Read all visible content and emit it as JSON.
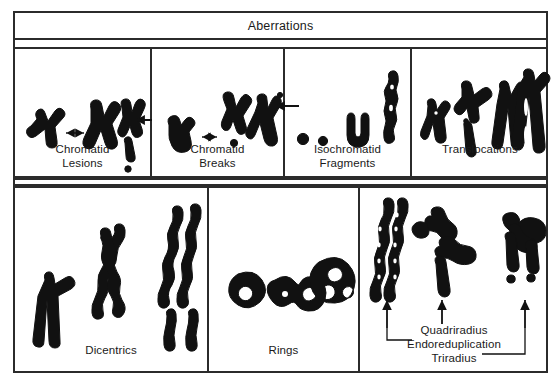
{
  "figure": {
    "header_label": "Aberrations",
    "bottom_caption": "",
    "line_color": "#2b2b2b",
    "ink_color": "#111111",
    "background": "#ffffff"
  },
  "table": {
    "rows": [
      {
        "row_index": 1,
        "cells": [
          {
            "id": "chromatid-lesions",
            "caption_line1": "Chromatid",
            "caption_line2": "Lesions",
            "figure_count": 3
          },
          {
            "id": "chromatid-breaks",
            "caption_line1": "Chromatid",
            "caption_line2": "Breaks",
            "figure_count": 3
          },
          {
            "id": "isochromatid-fragments",
            "caption_line1": "Isochromatid",
            "caption_line2": "Fragments",
            "figure_count": 4
          },
          {
            "id": "translocations",
            "caption_line1": "Translocations",
            "caption_line2": "",
            "figure_count": 4
          }
        ]
      },
      {
        "row_index": 2,
        "cells": [
          {
            "id": "dicentrics",
            "caption_line1": "Dicentrics",
            "caption_line2": "",
            "figure_count": 3
          },
          {
            "id": "rings",
            "caption_line1": "Rings",
            "caption_line2": "",
            "figure_count": 3
          },
          {
            "id": "radials",
            "caption_line1": "",
            "caption_line2": "",
            "figure_count": 3,
            "annotations": [
              {
                "label": "Quadriradius",
                "points_to": "center-figure",
                "leader": "straight-arrow-up"
              },
              {
                "label": "Endoreduplication",
                "points_to": "left-figure",
                "leader": "elbow-left-arrow-up"
              },
              {
                "label": "Triradius",
                "points_to": "right-figure",
                "leader": "elbow-right-arrow-up"
              }
            ]
          }
        ]
      }
    ]
  }
}
